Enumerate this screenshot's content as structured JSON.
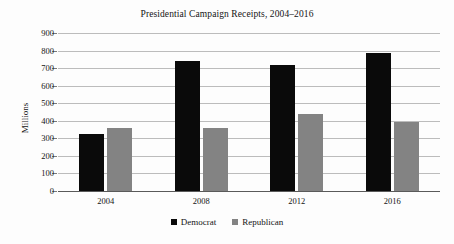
{
  "chart_data": {
    "type": "bar",
    "title": "Presidential Campaign Receipts, 2004–2016",
    "xlabel": "",
    "ylabel": "Millions",
    "categories": [
      "2004",
      "2008",
      "2012",
      "2016"
    ],
    "series": [
      {
        "name": "Democrat",
        "color": "#0a0a0a",
        "values": [
          325,
          740,
          715,
          785
        ]
      },
      {
        "name": "Republican",
        "color": "#838383",
        "values": [
          360,
          360,
          440,
          395
        ]
      }
    ],
    "ylim": [
      0,
      900
    ],
    "ytick_step": 100,
    "yticks": [
      "900",
      "800",
      "700",
      "600",
      "500",
      "400",
      "300",
      "200",
      "100",
      "0"
    ],
    "ytick_values": [
      900,
      800,
      700,
      600,
      500,
      400,
      300,
      200,
      100,
      0
    ],
    "grid": true,
    "grid_axis": "y",
    "legend_position": "bottom-center",
    "legend_entries": [
      "Democrat",
      "Republican"
    ],
    "background_color": "#fdfdfd",
    "gridline_color": "#bcbcbc",
    "axis_color": "#5a5a5a"
  }
}
